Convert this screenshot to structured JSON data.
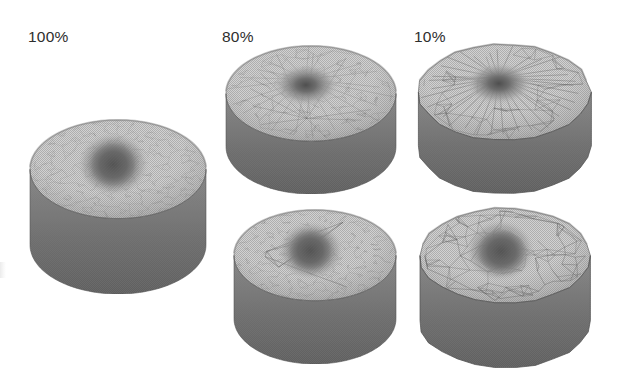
{
  "figure": {
    "caption_labels": [
      {
        "id": "col-100",
        "text": "100%",
        "x": 28,
        "y": 29
      },
      {
        "id": "col-80",
        "text": "80%",
        "x": 222,
        "y": 29
      },
      {
        "id": "col-10",
        "text": "10%",
        "x": 414,
        "y": 29
      }
    ],
    "background": "#ffffff",
    "ink_color": "#2e2e2e"
  },
  "palette": {
    "top_surface_light": "#d2d2d2",
    "top_surface_mid": "#bcbcbc",
    "depression_dark": "#6b6b6b",
    "depression_core": "#545454",
    "side_wall": "#8c8c8c",
    "side_wall_shadow": "#6f6f6f",
    "rim_edge": "#707070",
    "mesh_line": "#5a5a5a",
    "outline": "#555555"
  },
  "specimens": [
    {
      "id": "mesh-100-percent",
      "name": "mesh-100-percent-full-resolution",
      "column_label": "100%",
      "row": "top",
      "x": 28,
      "y": 118,
      "w": 180,
      "h": 176,
      "mesh_density": "fine",
      "surface_feature": "central-depression",
      "radial_spokes": 0,
      "coarse_edges": 0,
      "silhouette": "smooth-ellipse"
    },
    {
      "id": "mesh-80-percent-top",
      "name": "mesh-80-percent-cone-view",
      "column_label": "80%",
      "row": "top",
      "x": 224,
      "y": 44,
      "w": 174,
      "h": 150,
      "mesh_density": "medium",
      "surface_feature": "radial-cone-depression",
      "radial_spokes": 22,
      "coarse_edges": 40,
      "silhouette": "smooth-ellipse"
    },
    {
      "id": "mesh-10-percent-top",
      "name": "mesh-10-percent-cone-view",
      "column_label": "10%",
      "row": "top",
      "x": 416,
      "y": 42,
      "w": 176,
      "h": 152,
      "mesh_density": "coarse",
      "surface_feature": "radial-cone-depression",
      "radial_spokes": 34,
      "coarse_edges": 60,
      "silhouette": "faceted-polygon"
    },
    {
      "id": "mesh-80-percent-bottom",
      "name": "mesh-80-percent-depression-view",
      "column_label": "80%",
      "row": "bottom",
      "x": 232,
      "y": 208,
      "w": 166,
      "h": 156,
      "mesh_density": "fine",
      "surface_feature": "central-depression",
      "radial_spokes": 0,
      "coarse_edges": 6,
      "silhouette": "smooth-ellipse"
    },
    {
      "id": "mesh-10-percent-bottom",
      "name": "mesh-10-percent-depression-view",
      "column_label": "10%",
      "row": "bottom",
      "x": 418,
      "y": 206,
      "w": 174,
      "h": 162,
      "mesh_density": "coarse",
      "surface_feature": "central-depression",
      "radial_spokes": 0,
      "coarse_edges": 55,
      "silhouette": "faceted-polygon"
    }
  ]
}
